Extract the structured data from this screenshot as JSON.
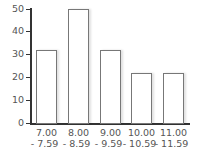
{
  "chart_data": {
    "type": "bar",
    "title": "",
    "xlabel": "",
    "ylabel": "",
    "categories": [
      "7.00 - 7.59",
      "8.00 - 8.59",
      "9.00 - 9.59",
      "10.00 - 10.59",
      "11.00 - 11.59"
    ],
    "category_lines": [
      [
        "7.00",
        "- 7.59"
      ],
      [
        "8.00",
        "- 8.59"
      ],
      [
        "9.00",
        "- 9.59"
      ],
      [
        "10.00",
        "- 10.59"
      ],
      [
        "11.00",
        "- 11.59"
      ]
    ],
    "values": [
      32,
      50,
      32,
      22,
      22
    ],
    "ylim": [
      0,
      50
    ],
    "yticks": [
      0,
      10,
      20,
      30,
      40,
      50
    ],
    "grid": false,
    "legend": null,
    "colors": {
      "bar_fill": "#ffffff",
      "bar_edge": "#777777",
      "axis": "#333333"
    }
  }
}
